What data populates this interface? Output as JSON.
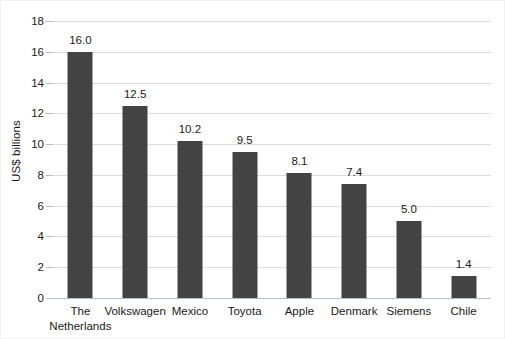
{
  "chart_data": {
    "type": "bar",
    "title": "",
    "xlabel": "",
    "ylabel": "US$ billions",
    "ylim": [
      0,
      18
    ],
    "yticks": [
      0,
      2,
      4,
      6,
      8,
      10,
      12,
      14,
      16,
      18
    ],
    "ytick_labels": [
      "0",
      "2",
      "4",
      "6",
      "8",
      "10",
      "12",
      "14",
      "16",
      "18"
    ],
    "grid": true,
    "legend": false,
    "categories": [
      "The Netherlands",
      "Volkswagen",
      "Mexico",
      "Toyota",
      "Apple",
      "Denmark",
      "Siemens",
      "Chile"
    ],
    "category_lines": [
      [
        "The",
        "Netherlands"
      ],
      [
        "Volkswagen"
      ],
      [
        "Mexico"
      ],
      [
        "Toyota"
      ],
      [
        "Apple"
      ],
      [
        "Denmark"
      ],
      [
        "Siemens"
      ],
      [
        "Chile"
      ]
    ],
    "values": [
      16.0,
      12.5,
      10.2,
      9.5,
      8.1,
      7.4,
      5.0,
      1.4
    ],
    "value_labels": [
      "16.0",
      "12.5",
      "10.2",
      "9.5",
      "8.1",
      "7.4",
      "5.0",
      "1.4"
    ],
    "bar_color": "#434343",
    "grid_color": "#d9dde2",
    "axis_color": "#b8bec6",
    "background_color": "#ffffff",
    "text_color": "#1a1a1a"
  }
}
